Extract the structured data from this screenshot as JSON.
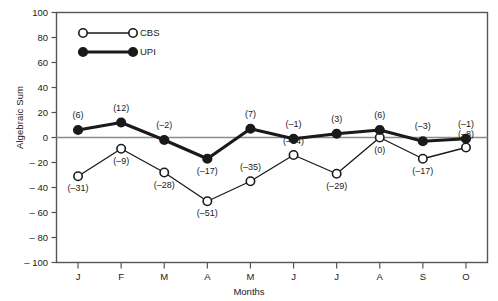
{
  "chart_data": {
    "type": "line",
    "title": "",
    "xlabel": "Months",
    "ylabel": "Algebraic Sum",
    "categories": [
      "J",
      "F",
      "M",
      "A",
      "M",
      "J",
      "J",
      "A",
      "S",
      "O"
    ],
    "ylim": [
      -100,
      100
    ],
    "yticks": [
      100,
      80,
      60,
      40,
      20,
      0,
      -20,
      -40,
      -60,
      -80,
      -100
    ],
    "ytick_labels": [
      "100",
      "80",
      "60",
      "40",
      "20",
      "0",
      "– 20",
      "– 40",
      "– 60",
      "– 80",
      "– 100"
    ],
    "grid": false,
    "zero_line": true,
    "legend_position": "upper-left-inside",
    "series": [
      {
        "name": "CBS",
        "marker": "open-circle",
        "values": [
          -31,
          -9,
          -28,
          -51,
          -35,
          -14,
          -29,
          0,
          -17,
          -8
        ],
        "labels": [
          "(–31)",
          "(–9)",
          "(–28)",
          "(–51)",
          "(–35)",
          "(–14)",
          "(–29)",
          "(0)",
          "(–17)",
          "(–8)"
        ]
      },
      {
        "name": "UPI",
        "marker": "filled-circle",
        "values": [
          6,
          12,
          -2,
          -17,
          7,
          -1,
          3,
          6,
          -3,
          -1
        ],
        "labels": [
          "(6)",
          "(12)",
          "(–2)",
          "(–17)",
          "(7)",
          "(–1)",
          "(3)",
          "(6)",
          "(–3)",
          "(–1)"
        ]
      }
    ]
  },
  "legend": {
    "entries": [
      {
        "label": "CBS",
        "marker": "open-circle"
      },
      {
        "label": "UPI",
        "marker": "filled-circle"
      }
    ]
  },
  "colors": {
    "line": "#1a1a1a",
    "background": "#ffffff",
    "axis": "#555555",
    "zero_line": "#888888"
  }
}
